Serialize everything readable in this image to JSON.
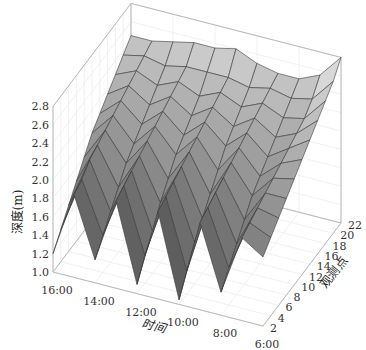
{
  "chart_data": {
    "type": "surface3d",
    "title": "",
    "xlabel": "时间",
    "ylabel": "观测点",
    "zlabel": "深度(m)",
    "x_ticks": [
      "16:00",
      "14:00",
      "12:00",
      "10:00",
      "8:00",
      "6:00"
    ],
    "x_values": [
      16,
      14,
      12,
      10,
      8,
      6
    ],
    "y_ticks": [
      "2",
      "4",
      "6",
      "8",
      "10",
      "12",
      "14",
      "16",
      "18",
      "20",
      "22"
    ],
    "y_values": [
      2,
      4,
      6,
      8,
      10,
      12,
      14,
      16,
      18,
      20,
      22
    ],
    "z_ticks": [
      "1.0",
      "1.2",
      "1.4",
      "1.6",
      "1.8",
      "2.0",
      "2.2",
      "2.4",
      "2.6",
      "2.8"
    ],
    "zlim": [
      1.0,
      2.8
    ],
    "colormap": "gray",
    "time_samples": [
      16,
      15,
      14,
      13,
      12,
      11,
      10,
      9,
      8,
      7,
      6
    ],
    "obs_samples": [
      2,
      4,
      6,
      8,
      10,
      12,
      14,
      16,
      18,
      20,
      22
    ],
    "z_grid": [
      [
        1.2,
        1.9,
        1.25,
        1.95,
        1.1,
        1.95,
        1.05,
        1.95,
        1.25,
        1.9,
        1.75
      ],
      [
        1.35,
        1.95,
        1.4,
        2.0,
        1.3,
        2.0,
        1.25,
        2.0,
        1.4,
        1.95,
        1.85
      ],
      [
        1.5,
        2.05,
        1.55,
        2.05,
        1.45,
        2.05,
        1.45,
        2.05,
        1.55,
        2.0,
        1.95
      ],
      [
        1.65,
        2.1,
        1.7,
        2.1,
        1.65,
        2.1,
        1.6,
        2.1,
        1.7,
        2.05,
        2.05
      ],
      [
        1.8,
        2.15,
        1.85,
        2.15,
        1.8,
        2.15,
        1.75,
        2.15,
        1.85,
        2.1,
        2.15
      ],
      [
        1.95,
        2.2,
        1.95,
        2.2,
        1.95,
        2.2,
        1.9,
        2.2,
        1.95,
        2.15,
        2.25
      ],
      [
        2.05,
        2.25,
        2.05,
        2.25,
        2.05,
        2.25,
        2.05,
        2.25,
        2.05,
        2.2,
        2.35
      ],
      [
        2.15,
        2.3,
        2.15,
        2.3,
        2.15,
        2.3,
        2.15,
        2.3,
        2.15,
        2.25,
        2.45
      ],
      [
        2.25,
        2.35,
        2.25,
        2.35,
        2.25,
        2.35,
        2.25,
        2.35,
        2.25,
        2.3,
        2.55
      ],
      [
        2.35,
        2.4,
        2.35,
        2.4,
        2.4,
        2.4,
        2.35,
        2.4,
        2.35,
        2.4,
        2.65
      ],
      [
        2.45,
        2.45,
        2.5,
        2.55,
        2.55,
        2.6,
        2.5,
        2.45,
        2.45,
        2.55,
        2.8
      ]
    ],
    "grid": true,
    "legend": "none"
  },
  "projection": {
    "origin": [
      53,
      272
    ],
    "x_end": [
      263,
      326
    ],
    "y_end_from_x_end": [
      341,
      223
    ],
    "z_px_per_unit": 92
  },
  "box_color": "#b8b8b8",
  "grid_color": "#ececec",
  "edge_color": "#3a3a3a"
}
